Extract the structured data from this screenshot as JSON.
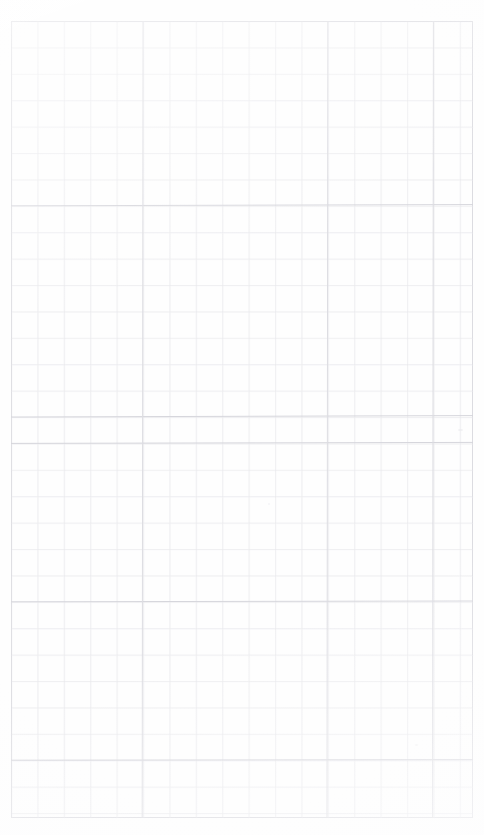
{
  "document": {
    "title": "Blank Grid Paper",
    "kind": "scanned-page",
    "caption": "",
    "page_width": 484,
    "page_height": 835,
    "background_color": "#ffffff",
    "paper_color": "#fefefe"
  },
  "grid": {
    "name": "graph-paper-grid",
    "origin_x": 11,
    "origin_y": 21,
    "width": 462,
    "height": 797,
    "cell_size": 26.4,
    "columns": 18,
    "rows": 30,
    "line_color": "#e2e2e6",
    "line_color_strong": "#d4d4da",
    "line_width": 1,
    "border_color": "#dcdce1"
  },
  "artifacts": {
    "speck_right_label": "scan-speck",
    "speck_low_label": "scan-speck",
    "speck_mid_label": "scan-speck"
  },
  "chart_data": {
    "type": "table",
    "title": "",
    "xlabel": "",
    "ylabel": "",
    "categories": [],
    "values": [],
    "note": "Blank graph paper: no plotted data, axes, ticks, legend or annotations are present."
  }
}
